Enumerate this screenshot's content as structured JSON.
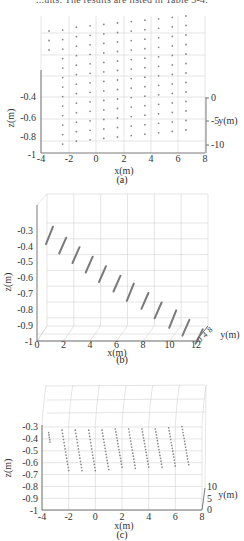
{
  "header": {
    "text": "...ults. The results are listed in Table 3-4."
  },
  "chart_data": [
    {
      "id": "a",
      "type": "scatter",
      "caption": "(a)",
      "view": "3d-top",
      "xlabel": "x(m)",
      "ylabel": "y(m)",
      "zlabel": "z(m)",
      "x_ticks": [
        "-4",
        "-2",
        "0",
        "2",
        "4",
        "6",
        "8"
      ],
      "y_ticks": [
        "0",
        "-5",
        "-10"
      ],
      "z_ticks": [
        "-0.4",
        "-0.6",
        "-0.8",
        "-1"
      ],
      "xlim": [
        -4,
        8
      ],
      "ylim": [
        -10,
        0
      ],
      "zlim": [
        -1,
        -0.3
      ],
      "grid": true,
      "description": "Grid of sample points viewed from above; ~11 columns x 13 rows, x from about -3.5 to 6.5"
    },
    {
      "id": "b",
      "type": "scatter",
      "caption": "(b)",
      "view": "3d-side",
      "xlabel": "x(m)",
      "ylabel": "y(m)",
      "zlabel": "z(m)",
      "x_ticks": [
        "0",
        "2",
        "4",
        "6",
        "8",
        "10",
        "12"
      ],
      "y_ticks": [
        "0",
        "4",
        "8"
      ],
      "z_ticks": [
        "-0.3",
        "-0.4",
        "-0.5",
        "-0.6",
        "-0.7",
        "-0.8",
        "-0.9",
        "-1"
      ],
      "xlim": [
        0,
        12
      ],
      "zlim": [
        -1,
        -0.25
      ],
      "grid": true,
      "series": [
        {
          "name": "column segments",
          "x_start": [
            0.3,
            1.3,
            2.3,
            3.3,
            4.3,
            5.4,
            6.4,
            7.5,
            8.5,
            9.6,
            10.6,
            11.6
          ],
          "z_top": [
            -0.26,
            -0.33,
            -0.39,
            -0.45,
            -0.51,
            -0.57,
            -0.62,
            -0.68,
            -0.74,
            -0.79,
            -0.85,
            -0.91
          ],
          "z_bottom": [
            -0.37,
            -0.43,
            -0.49,
            -0.55,
            -0.61,
            -0.67,
            -0.73,
            -0.78,
            -0.84,
            -0.9,
            -0.95,
            -1.0
          ]
        }
      ]
    },
    {
      "id": "c",
      "type": "scatter",
      "caption": "(c)",
      "view": "3d-front",
      "xlabel": "x(m)",
      "ylabel": "y(m)",
      "zlabel": "z(m)",
      "x_ticks": [
        "-4",
        "-2",
        "0",
        "2",
        "4",
        "6",
        "8"
      ],
      "y_ticks": [
        "0",
        "5",
        "10"
      ],
      "z_ticks": [
        "-0.3",
        "-0.4",
        "-0.5",
        "-0.6",
        "-0.7",
        "-0.8",
        "-0.9",
        "-1"
      ],
      "xlim": [
        -4,
        8
      ],
      "zlim": [
        -1,
        -0.3
      ],
      "grid": true,
      "series": [
        {
          "name": "point columns",
          "x_top": [
            -3.5,
            -2.5,
            -1.5,
            -0.5,
            0.5,
            1.5,
            2.5,
            3.5,
            4.5,
            5.5,
            6.5
          ],
          "x_bottom": [
            -3.4,
            -2.0,
            -1.0,
            0.0,
            1.0,
            2.0,
            3.0,
            4.0,
            5.0,
            6.0,
            7.0
          ],
          "z_top": [
            -0.33,
            -0.31,
            -0.31,
            -0.31,
            -0.31,
            -0.3,
            -0.3,
            -0.3,
            -0.3,
            -0.29,
            -0.28
          ],
          "z_bottom": [
            -0.41,
            -0.65,
            -0.65,
            -0.65,
            -0.64,
            -0.62,
            -0.63,
            -0.62,
            -0.62,
            -0.61,
            -0.6
          ]
        }
      ]
    }
  ]
}
